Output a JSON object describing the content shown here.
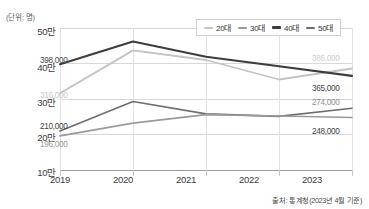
{
  "unit_note": "(단위: 명)",
  "source_note": "출처: 통계청(2023년 4월 기준)",
  "legend": {
    "items": [
      {
        "label": "20대",
        "color": "#c3c3c3"
      },
      {
        "label": "30대",
        "color": "#9a9a9a"
      },
      {
        "label": "40대",
        "color": "#3d3d3d"
      },
      {
        "label": "50대",
        "color": "#6e6e6e"
      }
    ]
  },
  "axis": {
    "y_ticks": [
      "50만",
      "40만",
      "30만",
      "20만",
      "10만"
    ],
    "y_values": [
      500000,
      400000,
      300000,
      200000,
      100000
    ],
    "x_ticks": [
      "2019",
      "2020",
      "2021",
      "2022",
      "2023"
    ]
  },
  "value_labels": {
    "left_20dae": "316,000",
    "left_30dae": "196,000",
    "left_40dae": "398,000",
    "left_50dae": "210,000",
    "right_20dae": "386,000",
    "right_40dae": "365,000",
    "right_50dae": "274,000",
    "right_30dae": "248,000"
  },
  "chart_data": {
    "type": "line",
    "title": "",
    "subtitle": "",
    "xlabel": "",
    "ylabel": "(단위: 명)",
    "x": [
      "2019",
      "2020",
      "2021",
      "2022",
      "2023"
    ],
    "categories": [
      "2019",
      "2020",
      "2021",
      "2022",
      "2023"
    ],
    "ylim": [
      100000,
      500000
    ],
    "ytick_values": [
      100000,
      200000,
      300000,
      400000,
      500000
    ],
    "ytick_labels": [
      "10만",
      "20만",
      "30만",
      "40만",
      "50만"
    ],
    "grid": true,
    "legend_position": "top-right",
    "series": [
      {
        "name": "20대",
        "color": "#c3c3c3",
        "values": [
          316000,
          437000,
          410000,
          355000,
          386000
        ],
        "labels": {
          "2019": "316,000",
          "2023": "386,000"
        }
      },
      {
        "name": "30대",
        "color": "#9a9a9a",
        "values": [
          196000,
          232000,
          256000,
          252000,
          248000
        ],
        "labels": {
          "2019": "196,000",
          "2023": "248,000"
        }
      },
      {
        "name": "40대",
        "color": "#3d3d3d",
        "values": [
          398000,
          462000,
          419000,
          392000,
          365000
        ],
        "labels": {
          "2019": "398,000",
          "2023": "365,000"
        }
      },
      {
        "name": "50대",
        "color": "#6e6e6e",
        "values": [
          210000,
          293000,
          258000,
          251000,
          274000
        ],
        "labels": {
          "2019": "210,000",
          "2023": "274,000"
        }
      }
    ],
    "annotations": [
      "출처: 통계청(2023년 4월 기준)"
    ]
  }
}
